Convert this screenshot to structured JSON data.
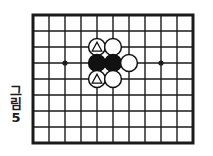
{
  "figure": {
    "caption_chars": [
      "그",
      "림"
    ],
    "caption_number": "5",
    "caption_full": "그림 5"
  },
  "board": {
    "type": "go-board-diagram",
    "line_color": "#1a1a1a",
    "background_color": "#ffffff",
    "border_label": "thick-outer-border",
    "columns": 11,
    "rows": 9,
    "cell_size_px": 16,
    "origin_x": 33,
    "origin_y": 15,
    "star_points": [
      {
        "col": 2,
        "row": 3,
        "name": "star-point-left"
      },
      {
        "col": 8,
        "row": 3,
        "name": "star-point-right"
      }
    ]
  },
  "stones": [
    {
      "id": "stone-white-triangle-top",
      "col": 4,
      "row": 2,
      "color": "white",
      "fill": "#ffffff",
      "edge": "#111111",
      "mark": "triangle",
      "label": "white-stone-marked-top"
    },
    {
      "id": "stone-white-top-right",
      "col": 5,
      "row": 2,
      "color": "white",
      "fill": "#ffffff",
      "edge": "#111111",
      "mark": "none",
      "label": "white-stone-top-right"
    },
    {
      "id": "stone-black-left",
      "col": 4,
      "row": 3,
      "color": "black",
      "fill": "#111111",
      "edge": "#111111",
      "mark": "none",
      "label": "black-stone-left"
    },
    {
      "id": "stone-black-right",
      "col": 5,
      "row": 3,
      "color": "black",
      "fill": "#111111",
      "edge": "#111111",
      "mark": "none",
      "label": "black-stone-right"
    },
    {
      "id": "stone-white-right",
      "col": 6,
      "row": 3,
      "color": "white",
      "fill": "#ffffff",
      "edge": "#111111",
      "mark": "none",
      "label": "white-stone-right"
    },
    {
      "id": "stone-white-triangle-bottom",
      "col": 4,
      "row": 4,
      "color": "white",
      "fill": "#ffffff",
      "edge": "#111111",
      "mark": "triangle",
      "label": "white-stone-marked-bottom"
    },
    {
      "id": "stone-white-bottom-right",
      "col": 5,
      "row": 4,
      "color": "white",
      "fill": "#ffffff",
      "edge": "#111111",
      "mark": "none",
      "label": "white-stone-bottom-right"
    }
  ],
  "counts": {
    "black_stones": 2,
    "white_stones": 5,
    "marked_stones": 2
  }
}
